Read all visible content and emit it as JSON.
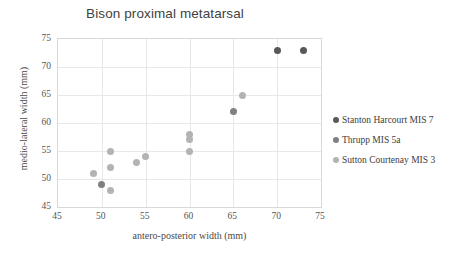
{
  "chart_data": {
    "type": "scatter",
    "title": "Bison proximal metatarsal",
    "xlabel": "antero-posterior width (mm)",
    "ylabel": "medio-lateral width (mm)",
    "xlim": [
      45,
      75
    ],
    "ylim": [
      45,
      75
    ],
    "xticks": [
      45,
      50,
      55,
      60,
      65,
      70,
      75
    ],
    "yticks": [
      45,
      50,
      55,
      60,
      65,
      70,
      75
    ],
    "grid": true,
    "legend_position": "right",
    "series": [
      {
        "name": "Stanton Harcourt MIS 7",
        "color": "#595959",
        "points": [
          {
            "x": 70,
            "y": 73
          },
          {
            "x": 73,
            "y": 73
          }
        ]
      },
      {
        "name": "Thrupp MIS 5a",
        "color": "#808080",
        "points": [
          {
            "x": 50,
            "y": 49
          },
          {
            "x": 65,
            "y": 62
          }
        ]
      },
      {
        "name": "Sutton Courtenay MIS 3",
        "color": "#b3b3b3",
        "points": [
          {
            "x": 49,
            "y": 51
          },
          {
            "x": 51,
            "y": 55
          },
          {
            "x": 51,
            "y": 52
          },
          {
            "x": 51,
            "y": 48
          },
          {
            "x": 54,
            "y": 53
          },
          {
            "x": 55,
            "y": 54
          },
          {
            "x": 60,
            "y": 58
          },
          {
            "x": 60,
            "y": 57
          },
          {
            "x": 60,
            "y": 55
          },
          {
            "x": 66,
            "y": 65
          }
        ]
      }
    ]
  }
}
